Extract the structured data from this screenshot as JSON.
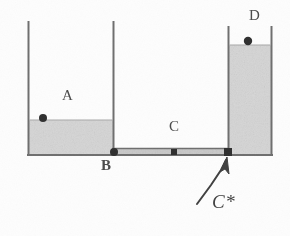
{
  "figure": {
    "background_color": "#fdfdfd",
    "ink_color": "#6b6b6b",
    "fluid_color": "#d6d6d6",
    "marker_color": "#2e2e2e",
    "annotation_color": "#3f3f3f"
  },
  "labels": {
    "a": "A",
    "b": "B",
    "c": "C",
    "d": "D",
    "c_star": "C*"
  },
  "vessels": [
    {
      "id": "vessel-a",
      "label": "A",
      "left_wall_x": 28,
      "right_wall_x": 113,
      "top_y": 22,
      "bottom_y": 155,
      "fill_level_y": 120,
      "filled": true
    },
    {
      "id": "vessel-middle",
      "label": "",
      "left_wall_x": 113,
      "right_wall_x": 228,
      "top_y": 22,
      "bottom_y": 155,
      "fill_level_y": 155,
      "filled": false
    },
    {
      "id": "vessel-d",
      "label": "D",
      "left_wall_x": 228,
      "right_wall_x": 272,
      "top_y": 27,
      "bottom_y": 155,
      "fill_level_y": 45,
      "filled": true
    }
  ],
  "channel": {
    "id": "channel-c",
    "label": "C",
    "left_x": 113,
    "right_x": 228,
    "top_y": 148,
    "bottom_y": 155
  },
  "markers": [
    {
      "id": "marker-a-surface",
      "label": "",
      "x": 43,
      "y": 118,
      "shape": "circle",
      "radius": 4
    },
    {
      "id": "marker-b",
      "label": "B",
      "x": 114,
      "y": 152,
      "shape": "circle",
      "radius": 4
    },
    {
      "id": "marker-c-mid",
      "label": "",
      "x": 174,
      "y": 152,
      "shape": "square",
      "radius": 3
    },
    {
      "id": "marker-c-star",
      "label": "C*",
      "x": 228,
      "y": 152,
      "shape": "square",
      "radius": 4
    },
    {
      "id": "marker-d-surface",
      "label": "",
      "x": 248,
      "y": 41,
      "shape": "circle",
      "radius": 4
    }
  ],
  "annotation": {
    "text": "C*",
    "arrow": {
      "tail_x": 197,
      "tail_y": 203,
      "head_x": 227,
      "head_y": 158
    }
  }
}
